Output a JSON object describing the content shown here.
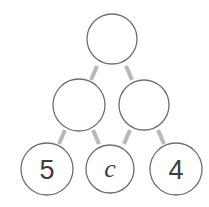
{
  "diagram": {
    "type": "number-pyramid",
    "rows": [
      {
        "row": 1,
        "nodes": [
          {
            "id": "top",
            "label": ""
          }
        ]
      },
      {
        "row": 2,
        "nodes": [
          {
            "id": "mid-left",
            "label": ""
          },
          {
            "id": "mid-right",
            "label": ""
          }
        ]
      },
      {
        "row": 3,
        "nodes": [
          {
            "id": "bottom-left",
            "label": "5"
          },
          {
            "id": "bottom-middle",
            "label": "c"
          },
          {
            "id": "bottom-right",
            "label": "4"
          }
        ]
      }
    ],
    "edges": [
      [
        "top",
        "mid-left"
      ],
      [
        "top",
        "mid-right"
      ],
      [
        "mid-left",
        "bottom-left"
      ],
      [
        "mid-left",
        "bottom-middle"
      ],
      [
        "mid-right",
        "bottom-middle"
      ],
      [
        "mid-right",
        "bottom-right"
      ]
    ],
    "colors": {
      "circle_stroke": "#6e6e6e",
      "edge": "#b9b9b9",
      "text": "#3d3d3d"
    }
  }
}
